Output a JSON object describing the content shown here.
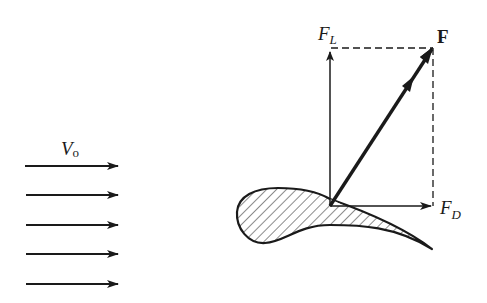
{
  "diagram": {
    "colors": {
      "ink": "#1a1a1a",
      "background": "#ffffff"
    },
    "free_stream": {
      "label_main": "V",
      "label_sub": "o",
      "arrow_count": 5,
      "arrow_y": [
        166,
        195,
        225,
        254,
        284
      ],
      "x_start": 25,
      "x_end": 118
    },
    "forces": {
      "lift": {
        "label_main": "F",
        "label_sub": "L"
      },
      "drag": {
        "label_main": "F",
        "label_sub": "D"
      },
      "resultant": {
        "label": "F"
      }
    },
    "origin": {
      "x": 330,
      "y": 206
    },
    "airfoil": {
      "fill_pattern": "diagonal-hatch"
    }
  }
}
